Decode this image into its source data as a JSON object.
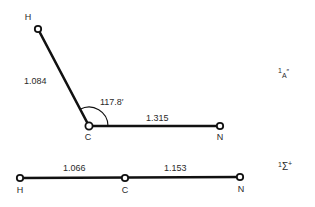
{
  "diagram": {
    "type": "molecular geometry",
    "structures": [
      {
        "id": "bent",
        "state_label": {
          "multiplicity": "1",
          "symbol": "A",
          "suffix": "″"
        },
        "atoms": [
          {
            "symbol": "H",
            "x": 38,
            "y": 29,
            "label_x": 28,
            "label_y": 20
          },
          {
            "symbol": "C",
            "x": 89,
            "y": 126,
            "label_x": 88,
            "label_y": 140
          },
          {
            "symbol": "N",
            "x": 220,
            "y": 126,
            "label_x": 220,
            "label_y": 140
          }
        ],
        "bonds": [
          {
            "from": "H",
            "to": "C",
            "length": "1.084",
            "label_x": 24,
            "label_y": 84
          },
          {
            "from": "C",
            "to": "N",
            "length": "1.315",
            "label_x": 146,
            "label_y": 121
          }
        ],
        "angle": {
          "value": "117.8′",
          "label_x": 100,
          "label_y": 105
        }
      },
      {
        "id": "linear",
        "state_label": {
          "multiplicity": "1",
          "symbol": "Σ",
          "suffix": "+"
        },
        "atoms": [
          {
            "symbol": "H",
            "x": 20,
            "y": 178,
            "label_x": 20,
            "label_y": 193
          },
          {
            "symbol": "C",
            "x": 125,
            "y": 178,
            "label_x": 125,
            "label_y": 193
          },
          {
            "symbol": "N",
            "x": 240,
            "y": 177,
            "label_x": 241,
            "label_y": 192
          }
        ],
        "bonds": [
          {
            "from": "H",
            "to": "C",
            "length": "1.066",
            "label_x": 63,
            "label_y": 171
          },
          {
            "from": "C",
            "to": "N",
            "length": "1.153",
            "label_x": 164,
            "label_y": 171
          }
        ]
      }
    ]
  }
}
